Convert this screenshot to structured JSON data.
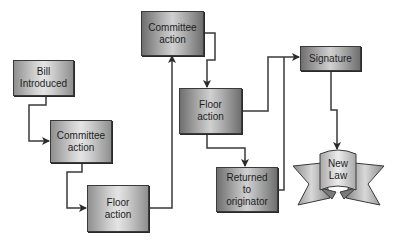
{
  "diagram": {
    "type": "flowchart",
    "title": "",
    "nodes": [
      {
        "id": "bill",
        "label": "Bill\nIntroduced"
      },
      {
        "id": "committee1",
        "label": "Committee\naction"
      },
      {
        "id": "floor1",
        "label": "Floor\naction"
      },
      {
        "id": "committee2",
        "label": "Committee\naction"
      },
      {
        "id": "floor2",
        "label": "Floor\naction"
      },
      {
        "id": "returned",
        "label": "Returned\nto\noriginator"
      },
      {
        "id": "signature",
        "label": "Signature"
      },
      {
        "id": "newlaw",
        "label": "New\nLaw"
      }
    ],
    "edges": [
      {
        "from": "bill",
        "to": "committee1"
      },
      {
        "from": "committee1",
        "to": "floor1"
      },
      {
        "from": "floor1",
        "to": "committee2"
      },
      {
        "from": "committee2",
        "to": "floor2"
      },
      {
        "from": "floor2",
        "to": "signature"
      },
      {
        "from": "floor2",
        "to": "returned"
      },
      {
        "from": "returned",
        "to": "signature"
      },
      {
        "from": "signature",
        "to": "newlaw"
      }
    ],
    "colors": {
      "line": "#3a3a3a",
      "box_mid": "#e4e4e4",
      "box_edge": "#8f8f8f"
    }
  }
}
